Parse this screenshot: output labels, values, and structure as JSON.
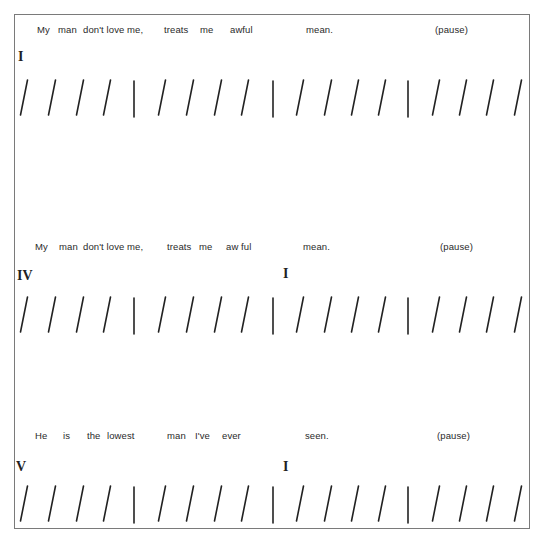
{
  "figure": {
    "type": "twelve-bar blues lyric/chord chart",
    "rows": [
      {
        "lyrics": [
          {
            "text": "My",
            "x": 37
          },
          {
            "text": "man",
            "x": 58
          },
          {
            "text": "don't love me,",
            "x": 83
          },
          {
            "text": "treats",
            "x": 164
          },
          {
            "text": "me",
            "x": 200
          },
          {
            "text": "awful",
            "x": 230
          },
          {
            "text": "mean.",
            "x": 306
          },
          {
            "text": "(pause)",
            "x": 435
          }
        ],
        "lyric_y": 24,
        "chords": [
          {
            "numeral": "I",
            "x": 18,
            "y": 49
          }
        ],
        "beats_y": 80,
        "beats": [
          "/",
          "/",
          "/",
          "/",
          "|",
          "/",
          "/",
          "/",
          "/",
          "|",
          "/",
          "/",
          "/",
          "/",
          "|",
          "/",
          "/",
          "/",
          "/"
        ]
      },
      {
        "lyrics": [
          {
            "text": "My",
            "x": 35
          },
          {
            "text": "man",
            "x": 59
          },
          {
            "text": "don't love me,",
            "x": 83
          },
          {
            "text": "treats",
            "x": 167
          },
          {
            "text": "me",
            "x": 199
          },
          {
            "text": "aw ful",
            "x": 226
          },
          {
            "text": "mean.",
            "x": 303
          },
          {
            "text": "(pause)",
            "x": 440
          }
        ],
        "lyric_y": 241,
        "chords": [
          {
            "numeral": "IV",
            "x": 17,
            "y": 268
          },
          {
            "numeral": "I",
            "x": 283,
            "y": 266
          }
        ],
        "beats_y": 297,
        "beats": [
          "/",
          "/",
          "/",
          "/",
          "|",
          "/",
          "/",
          "/",
          "/",
          "|",
          "/",
          "/",
          "/",
          "/",
          "|",
          "/",
          "/",
          "/",
          "/"
        ]
      },
      {
        "lyrics": [
          {
            "text": "He",
            "x": 35
          },
          {
            "text": "is",
            "x": 63
          },
          {
            "text": "the",
            "x": 87
          },
          {
            "text": "lowest",
            "x": 107
          },
          {
            "text": "man",
            "x": 167
          },
          {
            "text": "I've",
            "x": 195
          },
          {
            "text": "ever",
            "x": 222
          },
          {
            "text": "seen.",
            "x": 305
          },
          {
            "text": "(pause)",
            "x": 437
          }
        ],
        "lyric_y": 430,
        "chords": [
          {
            "numeral": "V",
            "x": 16,
            "y": 459
          },
          {
            "numeral": "I",
            "x": 283,
            "y": 459
          }
        ],
        "beats_y": 486,
        "beats": [
          "/",
          "/",
          "/",
          "/",
          "|",
          "/",
          "/",
          "/",
          "/",
          "|",
          "/",
          "/",
          "/",
          "/",
          "|",
          "/",
          "/",
          "/",
          "/"
        ]
      }
    ],
    "beat_x_positions": [
      24,
      52,
      80,
      107,
      134,
      162,
      190,
      218,
      245,
      273,
      300,
      328,
      355,
      382,
      408,
      436,
      463,
      490,
      518
    ],
    "colors": {
      "frame": "#7a7a7a",
      "ink": "#222222",
      "text": "#2a2a2a"
    }
  }
}
